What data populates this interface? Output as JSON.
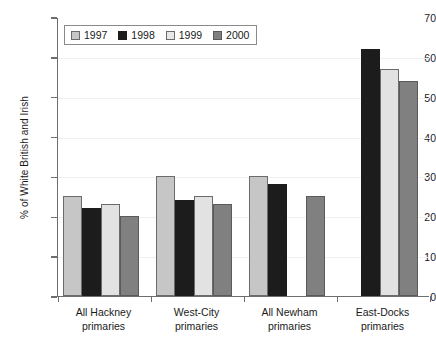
{
  "chart_data": {
    "type": "bar",
    "title": "",
    "subtitle": "",
    "xlabel": "",
    "ylabel": "% of White British and Irish",
    "ylim": [
      0,
      70
    ],
    "ytick_step": 10,
    "yticks": [
      "70",
      "60",
      "50",
      "40",
      "30",
      "20",
      "10",
      "0"
    ],
    "grid": true,
    "legend_position": "top-left",
    "categories": [
      "All Hackney primaries",
      "West-City primaries",
      "All Newham primaries",
      "East-Docks primaries"
    ],
    "category_lines": [
      [
        "All Hackney",
        "primaries"
      ],
      [
        "West-City",
        "primaries"
      ],
      [
        "All Newham",
        "primaries"
      ],
      [
        "East-Docks",
        "primaries"
      ]
    ],
    "series": [
      {
        "name": "1997",
        "color": "#c6c6c6",
        "values": [
          25,
          30,
          30,
          null
        ]
      },
      {
        "name": "1998",
        "color": "#1c1c1c",
        "values": [
          22,
          24,
          28,
          62
        ]
      },
      {
        "name": "1999",
        "color": "#e2e2e2",
        "values": [
          23,
          25,
          null,
          57
        ]
      },
      {
        "name": "2000",
        "color": "#808080",
        "values": [
          20,
          23,
          25,
          54
        ]
      }
    ]
  },
  "legend": {
    "entries": [
      {
        "label": "1997",
        "swatch": "legend-swatch-1997"
      },
      {
        "label": "1998",
        "swatch": "legend-swatch-1998"
      },
      {
        "label": "1999",
        "swatch": "legend-swatch-1999"
      },
      {
        "label": "2000",
        "swatch": "legend-swatch-2000"
      }
    ]
  },
  "axes": {
    "y_title": "% of White British and Irish"
  }
}
